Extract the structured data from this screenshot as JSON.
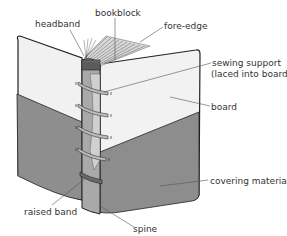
{
  "labels": {
    "headband": "headband",
    "bookblock": "bookblock",
    "fore_edge": "fore-edge",
    "sewing_support_line1": "sewing support",
    "sewing_support_line2": "(laced into board)",
    "board": "board",
    "covering_material": "covering material",
    "raised_band": "raised band",
    "spine": "spine"
  },
  "colors": {
    "board_light": "#f0f0f0",
    "covering_gray": "#8f8f8f",
    "spine_gray": "#a9a9a9",
    "outline": "#222222",
    "leader": "#555555"
  }
}
